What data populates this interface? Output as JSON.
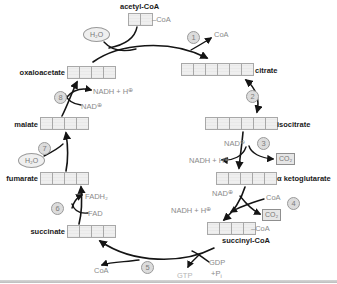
{
  "molecules": {
    "acetyl_coa": {
      "name": "acetyl-CoA",
      "carbons": 2,
      "attachment": "CoA"
    },
    "citrate": {
      "name": "citrate",
      "carbons": 6
    },
    "isocitrate": {
      "name": "isocitrate",
      "carbons": 6
    },
    "alpha_kg": {
      "name": "α ketoglutarate",
      "carbons": 5
    },
    "succinyl_coa": {
      "name": "succinyl-CoA",
      "carbons": 4,
      "attachment": "CoA"
    },
    "succinate": {
      "name": "succinate",
      "carbons": 4
    },
    "fumarate": {
      "name": "fumarate",
      "carbons": 4
    },
    "malate": {
      "name": "malate",
      "carbons": 4
    },
    "oxaloacetate": {
      "name": "oxaloacetate",
      "carbons": 4
    }
  },
  "steps": {
    "s1": "1",
    "s2": "2",
    "s3": "3",
    "s4": "4",
    "s5": "5",
    "s6": "6",
    "s7": "7",
    "s8": "8"
  },
  "cofactors": {
    "nad": "NAD",
    "nadh": "NADH + H",
    "coa": "CoA",
    "co2": "CO₂",
    "h2o": "H₂O",
    "fad": "FAD",
    "fadh2": "FADH₂",
    "gdp": "GDP",
    "pi_base": "+P",
    "pi_sub": "i",
    "gtp": "GTP"
  },
  "symbols": {
    "oplus": "⊕",
    "dash": "–"
  },
  "colors": {
    "arrow": "#141414",
    "metabolite_text": "#1a1a1a",
    "cofactor_text": "#8a8a8a",
    "gtp_text": "#b5b5b5",
    "cell_fill": "#ececec",
    "cell_border": "#a8a8a8",
    "step_circle_fill": "#dcdcdc"
  }
}
